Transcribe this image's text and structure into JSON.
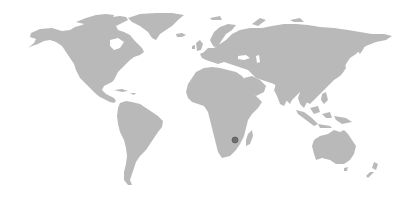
{
  "map": {
    "type": "world",
    "land_color": "#b9b9b9",
    "background_color": "#ffffff",
    "marker": {
      "label": "",
      "color": "#6e6e6e",
      "region": "southern-africa",
      "x": 235,
      "y": 140
    }
  }
}
